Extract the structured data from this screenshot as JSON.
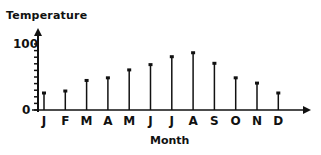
{
  "chart_data": {
    "type": "bar",
    "style": "stem",
    "title": "",
    "xlabel": "Month",
    "ylabel": "Temperature",
    "categories": [
      "J",
      "F",
      "M",
      "A",
      "M",
      "J",
      "J",
      "A",
      "S",
      "O",
      "N",
      "D"
    ],
    "values": [
      25,
      28,
      44,
      48,
      60,
      68,
      80,
      86,
      70,
      48,
      40,
      25
    ],
    "ylim": [
      0,
      100
    ],
    "y_ticks": [
      0,
      100
    ],
    "y_minor_tick_step": 10,
    "grid": false,
    "legend": null
  },
  "axes": {
    "y_label_top": "100",
    "y_label_bottom": "0"
  },
  "colors": {
    "ink": "#111111",
    "background": "#ffffff"
  }
}
